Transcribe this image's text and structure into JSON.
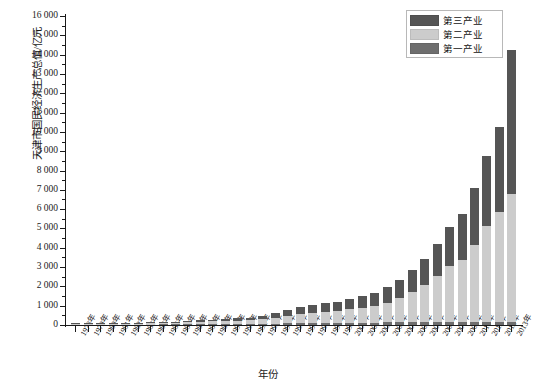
{
  "chart_data": {
    "type": "bar",
    "stacked": true,
    "title": "",
    "xlabel": "年份",
    "ylabel": "天津市国民经济生产总值/亿元",
    "ylim": [
      0,
      16000
    ],
    "ytick_step": 1000,
    "yticks": [
      "0",
      "1 000",
      "2 000",
      "3 000",
      "4 000",
      "5 000",
      "6 000",
      "7 000",
      "8 000",
      "9 000",
      "10 000",
      "11 000",
      "12 000",
      "13 000",
      "14 000",
      "15 000",
      "16 000"
    ],
    "grid": false,
    "legend_position": "top-right",
    "colors": {
      "tertiary": "#555555",
      "secondary": "#cccccc",
      "primary": "#6e6e6e",
      "axis": "#1a1a1a",
      "background": "#ffffff"
    },
    "categories": [
      "1978年",
      "1979年",
      "1980年",
      "1981年",
      "1982年",
      "1983年",
      "1984年",
      "1985年",
      "1986年",
      "1987年",
      "1988年",
      "1989年",
      "1990年",
      "1991年",
      "1992年",
      "1993年",
      "1994年",
      "1995年",
      "1996年",
      "1997年",
      "1998年",
      "1999年",
      "2000年",
      "2001年",
      "2002年",
      "2003年",
      "2004年",
      "2005年",
      "2006年",
      "2007年",
      "2008年",
      "2009年",
      "2010年",
      "2011年",
      "2012年",
      "2013年"
    ],
    "series": [
      {
        "name": "第一产业",
        "color": "#6e6e6e",
        "values": [
          12,
          13,
          14,
          15,
          17,
          20,
          24,
          27,
          29,
          33,
          40,
          45,
          50,
          53,
          56,
          62,
          78,
          93,
          105,
          112,
          117,
          120,
          124,
          127,
          130,
          133,
          137,
          141,
          145,
          149,
          154,
          159,
          163,
          167,
          172,
          176
        ]
      },
      {
        "name": "第二产业",
        "color": "#cccccc",
        "values": [
          51,
          54,
          58,
          60,
          64,
          70,
          80,
          92,
          100,
          113,
          130,
          147,
          160,
          175,
          195,
          230,
          300,
          380,
          460,
          530,
          570,
          610,
          680,
          760,
          860,
          1020,
          1260,
          1580,
          1930,
          2380,
          2900,
          3200,
          4000,
          4950,
          5700,
          6610
        ]
      },
      {
        "name": "第三产业",
        "color": "#555555",
        "values": [
          19,
          21,
          23,
          25,
          28,
          32,
          38,
          45,
          52,
          62,
          75,
          88,
          100,
          115,
          135,
          170,
          230,
          290,
          350,
          400,
          440,
          480,
          540,
          600,
          680,
          790,
          940,
          1130,
          1350,
          1660,
          2040,
          2380,
          2950,
          3630,
          4380,
          7430
        ]
      }
    ],
    "totals": [
      82,
      88,
      95,
      100,
      109,
      122,
      142,
      164,
      181,
      208,
      245,
      280,
      310,
      343,
      386,
      462,
      608,
      763,
      915,
      1042,
      1127,
      1210,
      1344,
      1487,
      1670,
      1943,
      2337,
      2851,
      3425,
      4189,
      5094,
      5739,
      7113,
      8747,
      10252,
      14216
    ]
  },
  "legend": {
    "items": [
      {
        "label": "第三产业",
        "key": "tertiary"
      },
      {
        "label": "第二产业",
        "key": "secondary"
      },
      {
        "label": "第一产业",
        "key": "primary"
      }
    ]
  }
}
